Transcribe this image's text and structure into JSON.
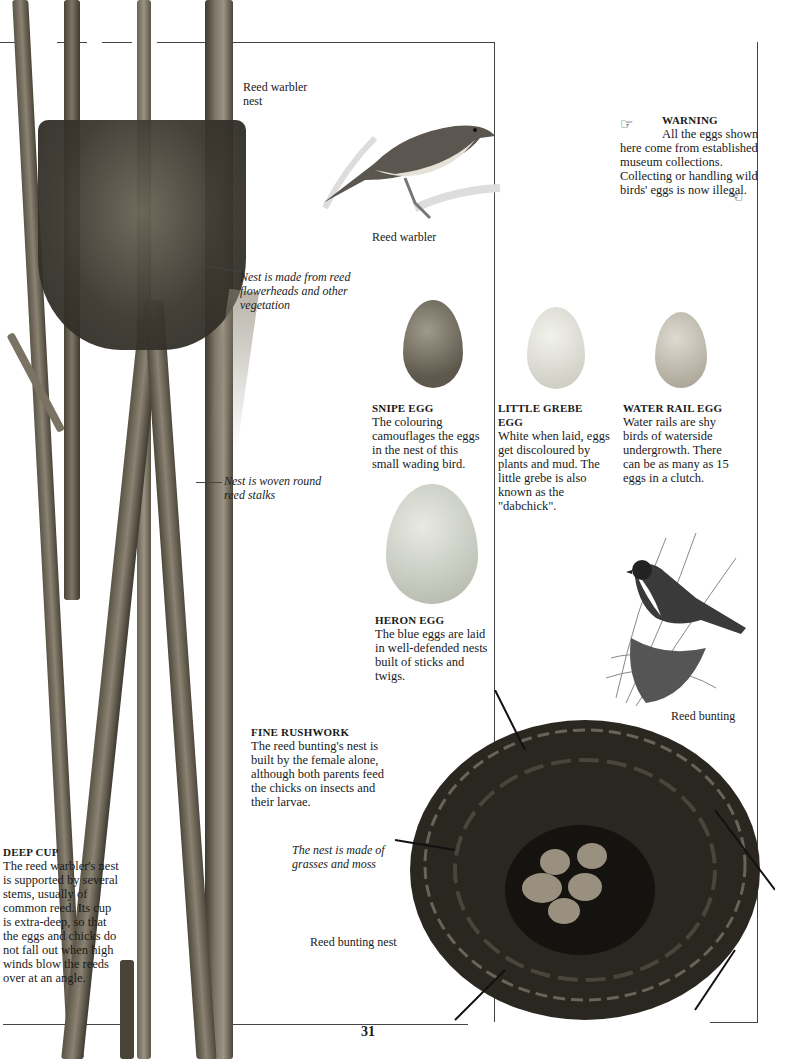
{
  "page": {
    "number": "31",
    "frame_color": "#444444"
  },
  "warning": {
    "title": "WARNING",
    "body": "All the eggs shown here come from established museum collections. Collecting or handling wild birds' eggs is now illegal.",
    "icons": [
      "pointing-hand-right-icon",
      "pointing-hand-left-icon"
    ]
  },
  "reed_warbler_nest": {
    "label": "Reed warbler nest",
    "annotation_1": "Nest is made from reed flowerheads and other vegetation",
    "annotation_2": "Nest is woven round reed stalks"
  },
  "reed_warbler": {
    "label": "Reed warbler"
  },
  "eggs": [
    {
      "title": "SNIPE EGG",
      "text": "The colouring camouflages the eggs in the nest of this small wading bird.",
      "color": "#7a7466"
    },
    {
      "title": "LITTLE GREBE EGG",
      "text": "White when laid, eggs get discoloured by plants and mud. The little grebe is also known as the \"dabchick\".",
      "color": "#d8d8d0"
    },
    {
      "title": "WATER RAIL EGG",
      "text": "Water rails are shy birds of waterside undergrowth. There can be as many as 15 eggs in a clutch.",
      "color": "#c4bfb2"
    },
    {
      "title": "HERON EGG",
      "text": "The blue eggs are laid in well-defended nests built of sticks and twigs.",
      "color": "#c9ccc2"
    }
  ],
  "reed_bunting": {
    "label": "Reed bunting"
  },
  "fine_rushwork": {
    "title": "FINE RUSHWORK",
    "text": "The reed bunting's nest is built by the female alone, although both parents feed the chicks on insects and their larvae."
  },
  "deep_cup": {
    "title": "DEEP CUP",
    "text": "The reed warbler's nest is supported by several stems, usually of common reed. Its cup is extra-deep, so that the eggs and chicks do not fall out when high winds blow the reeds over at an angle."
  },
  "reed_bunting_nest": {
    "label": "Reed bunting nest",
    "annotation": "The nest is made of grasses and moss"
  }
}
